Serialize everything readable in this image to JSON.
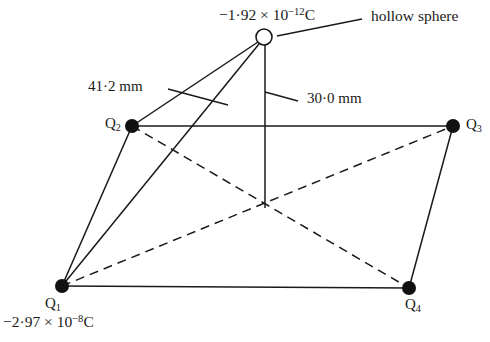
{
  "figure": {
    "background_color": "#ffffff",
    "stroke_color": "#1a1a1a"
  },
  "annotations": {
    "sphere_charge": {
      "mantissa": "−1·92 × 10",
      "exponent": "−12",
      "unit": "C",
      "full_text": "−1·92 × 10⁻¹² C"
    },
    "q1_charge": {
      "mantissa": "−2·97 × 10",
      "exponent": "−8",
      "unit": "C",
      "full_text": "−2·97 × 10⁻⁸ C"
    },
    "hollow_sphere_label": "hollow sphere",
    "dimension_left": "41·2 mm",
    "dimension_right": "30·0 mm"
  },
  "nodes": [
    {
      "id": "Q1",
      "label": "Q",
      "subscript": "1",
      "x": 62,
      "y": 286,
      "type": "filled-charge",
      "radius": 7
    },
    {
      "id": "Q2",
      "label": "Q",
      "subscript": "2",
      "x": 132,
      "y": 126,
      "type": "filled-charge",
      "radius": 7
    },
    {
      "id": "Q3",
      "label": "Q",
      "subscript": "3",
      "x": 453,
      "y": 126,
      "type": "filled-charge",
      "radius": 7
    },
    {
      "id": "Q4",
      "label": "Q",
      "subscript": "4",
      "x": 409,
      "y": 288,
      "type": "filled-charge",
      "radius": 7
    },
    {
      "id": "S",
      "label": "",
      "subscript": "",
      "x": 264,
      "y": 37,
      "type": "hollow-sphere",
      "radius": 8
    }
  ],
  "edges": [
    {
      "id": "q1-q2",
      "from": "Q1",
      "to": "Q2",
      "style": "solid"
    },
    {
      "id": "q1-sphere",
      "from": "Q1",
      "to": "S",
      "style": "solid"
    },
    {
      "id": "q1-q4",
      "from": "Q1",
      "to": "Q4",
      "style": "solid"
    },
    {
      "id": "q2-sphere",
      "from": "Q2",
      "to": "S",
      "style": "solid"
    },
    {
      "id": "q2-q3",
      "from": "Q2",
      "to": "Q3",
      "style": "solid"
    },
    {
      "id": "q3-q4",
      "from": "Q3",
      "to": "Q4",
      "style": "solid"
    },
    {
      "id": "sphere-drop",
      "from": "S",
      "to": "center",
      "style": "solid"
    },
    {
      "id": "q1-q3",
      "from": "Q1",
      "to": "Q3",
      "style": "dashed"
    },
    {
      "id": "q2-q4",
      "from": "Q2",
      "to": "Q4",
      "style": "dashed"
    }
  ],
  "center_point": {
    "x": 265,
    "y": 208
  },
  "leaders": [
    {
      "id": "sphere-leader",
      "x1": 362,
      "y1": 19,
      "x2": 277,
      "y2": 36
    },
    {
      "id": "left-dim-leader",
      "x1": 168,
      "y1": 89,
      "x2": 228,
      "y2": 105
    },
    {
      "id": "right-dim-leader",
      "x1": 297,
      "y1": 101,
      "x2": 265,
      "y2": 92
    }
  ],
  "label_positions": {
    "sphere_charge": {
      "x": 219,
      "y": 7
    },
    "hollow_sphere_label": {
      "x": 371,
      "y": 8
    },
    "dimension_left": {
      "x": 88,
      "y": 79
    },
    "dimension_right": {
      "x": 307,
      "y": 91
    },
    "q1": {
      "x": 45,
      "y": 296
    },
    "q2": {
      "x": 105,
      "y": 116
    },
    "q3": {
      "x": 466,
      "y": 117
    },
    "q4": {
      "x": 405,
      "y": 297
    },
    "q1_charge": {
      "x": 3,
      "y": 314
    }
  }
}
